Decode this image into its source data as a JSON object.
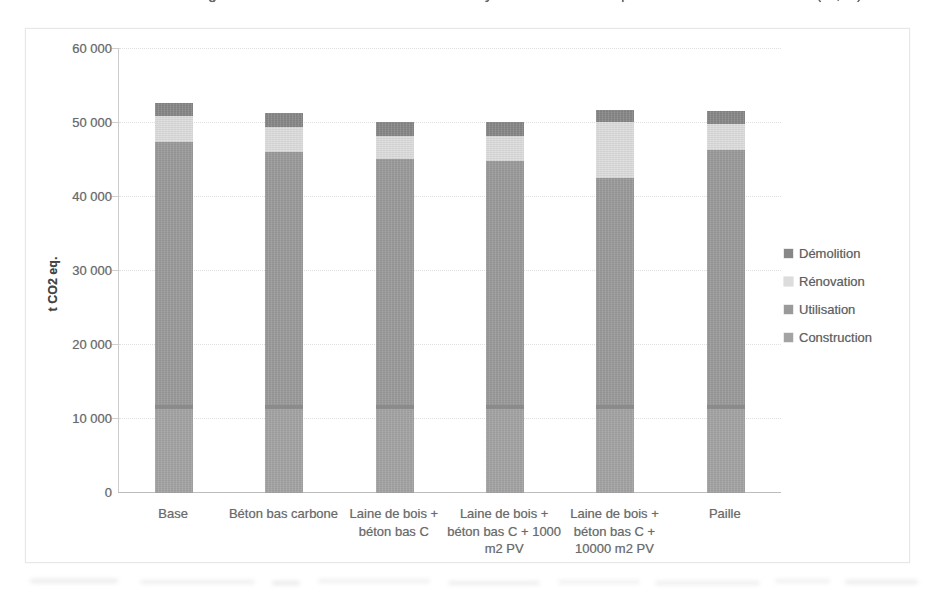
{
  "chart_data": {
    "type": "bar",
    "stacked": true,
    "categories": [
      "Base",
      "Béton bas carbone",
      "Laine de bois + béton bas C",
      "Laine de bois + béton bas C + 1000 m2 PV",
      "Laine de bois + béton bas C + 10000 m2 PV",
      "Paille"
    ],
    "series": [
      {
        "name": "Construction",
        "color": "#a3a3a3",
        "band_top_color": "#8b8b8b",
        "values": [
          11900,
          11900,
          11900,
          11900,
          11900,
          11900
        ]
      },
      {
        "name": "Utilisation",
        "color": "#9a9a9a",
        "values": [
          35500,
          34200,
          33200,
          33000,
          30700,
          34400
        ]
      },
      {
        "name": "Rénovation",
        "color": "#dcdcdc",
        "values": [
          3500,
          3400,
          3200,
          3400,
          7500,
          3600
        ]
      },
      {
        "name": "Démolition",
        "color": "#878787",
        "values": [
          1800,
          1900,
          1800,
          1800,
          1600,
          1700
        ]
      }
    ],
    "totals": [
      52700,
      51400,
      50100,
      50100,
      51700,
      51600
    ],
    "ylabel": "t CO2 eq.",
    "ylim": [
      0,
      60000
    ],
    "ytick_step": 10000,
    "ytick_labels": [
      "0",
      "10 000",
      "20 000",
      "30 000",
      "40 000",
      "50 000",
      "60 000"
    ],
    "grid": true,
    "legend_position": "right",
    "legend_order": [
      "Démolition",
      "Rénovation",
      "Utilisation",
      "Construction"
    ]
  },
  "legend_colors": {
    "Démolition": "#878787",
    "Rénovation": "#dcdcdc",
    "Utilisation": "#9a9a9a",
    "Construction": "#a3a3a3"
  },
  "cropped_title": {
    "note": "title line cut off at top edge; only glyph descenders visible",
    "fragments": [
      {
        "glyph": "g",
        "x": 208
      },
      {
        "glyph": "y",
        "x": 485
      },
      {
        "glyph": "p",
        "x": 621
      },
      {
        "glyph": "(",
        "x": 816
      },
      {
        "glyph": ",",
        "x": 836
      },
      {
        "glyph": ")",
        "x": 857
      }
    ]
  },
  "scan_artifacts": {
    "bottom_bands": [
      {
        "x": 30,
        "w": 88,
        "y": 579,
        "o": 0.2
      },
      {
        "x": 140,
        "w": 115,
        "y": 580,
        "o": 0.16
      },
      {
        "x": 272,
        "w": 28,
        "y": 581,
        "o": 0.22
      },
      {
        "x": 318,
        "w": 112,
        "y": 579,
        "o": 0.15
      },
      {
        "x": 448,
        "w": 92,
        "y": 581,
        "o": 0.18
      },
      {
        "x": 558,
        "w": 82,
        "y": 580,
        "o": 0.14
      },
      {
        "x": 655,
        "w": 105,
        "y": 581,
        "o": 0.17
      },
      {
        "x": 775,
        "w": 55,
        "y": 579,
        "o": 0.15
      },
      {
        "x": 845,
        "w": 73,
        "y": 580,
        "o": 0.2
      }
    ]
  }
}
